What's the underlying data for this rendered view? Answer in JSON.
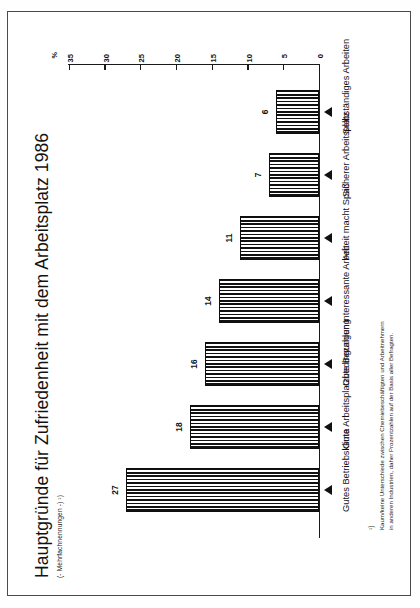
{
  "page": {
    "background": "#ffffff",
    "border_color": "#4a4a4a"
  },
  "chart_data": {
    "type": "bar",
    "title": "Hauptgründe für Zufriedenheit mit dem Arbeitsplatz 1986",
    "subtitle": "(- Mehrfachnennungen -) ¹)",
    "categories": [
      "Gutes Betriebsklima",
      "Gute Arbeitsplatzbedingungen",
      "Gute Bezahlung",
      "Interessante Arbeit",
      "Arbeit macht Spaß",
      "Sicherer Arbeitsplatz",
      "Selbständiges Arbeiten"
    ],
    "values": [
      27,
      18,
      16,
      14,
      11,
      7,
      6
    ],
    "xlabel": "",
    "ylabel": "%",
    "ylim": [
      0,
      35
    ],
    "yticks": [
      0,
      5,
      10,
      15,
      20,
      25,
      30,
      35
    ],
    "ytick_labels": [
      "0",
      "5",
      "10",
      "15",
      "20",
      "25",
      "30",
      "35"
    ],
    "unit": "%",
    "grid": false,
    "legend": false,
    "bar_fill": "vertical-hatch",
    "bar_color": "#111111",
    "orientation": "rotated-90-ccw"
  },
  "footnote": {
    "marker": "¹)",
    "text": "Kaum/keine Unterschiede zwischen Chemiebeschäftigten und Arbeitnehmern\nin anderen Industrien, daher Prozentzahlen auf der Basis aller Befragten."
  }
}
